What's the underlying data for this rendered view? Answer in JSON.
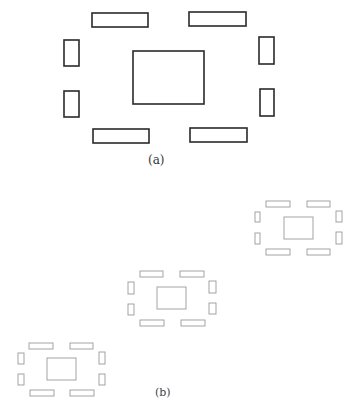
{
  "figure": {
    "panel_a": {
      "label": "(a)",
      "style": "dark",
      "stroke_color": "#2a2a2a",
      "center": {
        "x": 133,
        "y": 51,
        "w": 71,
        "h": 53
      },
      "bars": [
        {
          "name": "top-left-bar",
          "x": 92,
          "y": 13,
          "w": 56,
          "h": 14
        },
        {
          "name": "top-right-bar",
          "x": 189,
          "y": 12,
          "w": 57,
          "h": 14
        },
        {
          "name": "bottom-left-bar",
          "x": 93,
          "y": 129,
          "w": 56,
          "h": 14
        },
        {
          "name": "bottom-right-bar",
          "x": 190,
          "y": 128,
          "w": 57,
          "h": 14
        },
        {
          "name": "left-upper-block",
          "x": 64,
          "y": 40,
          "w": 15,
          "h": 26
        },
        {
          "name": "left-lower-block",
          "x": 64,
          "y": 91,
          "w": 15,
          "h": 26
        },
        {
          "name": "right-upper-block",
          "x": 259,
          "y": 37,
          "w": 15,
          "h": 27
        },
        {
          "name": "right-lower-block",
          "x": 260,
          "y": 89,
          "w": 14,
          "h": 27
        }
      ]
    },
    "panel_b": {
      "label": "(b)",
      "style": "light",
      "stroke_color": "#9a9a9a",
      "groups": [
        {
          "name": "group-upper-right",
          "center": {
            "x": 284,
            "y": 217,
            "w": 29,
            "h": 22
          },
          "bars": [
            {
              "x": 266,
              "y": 201,
              "w": 24,
              "h": 6
            },
            {
              "x": 307,
              "y": 201,
              "w": 23,
              "h": 6
            },
            {
              "x": 266,
              "y": 249,
              "w": 24,
              "h": 6
            },
            {
              "x": 307,
              "y": 249,
              "w": 23,
              "h": 6
            },
            {
              "x": 255,
              "y": 212,
              "w": 5,
              "h": 10
            },
            {
              "x": 255,
              "y": 233,
              "w": 5,
              "h": 11
            },
            {
              "x": 336,
              "y": 211,
              "w": 6,
              "h": 11
            },
            {
              "x": 336,
              "y": 232,
              "w": 6,
              "h": 12
            }
          ]
        },
        {
          "name": "group-middle",
          "center": {
            "x": 157,
            "y": 287,
            "w": 29,
            "h": 22
          },
          "bars": [
            {
              "x": 140,
              "y": 271,
              "w": 23,
              "h": 6
            },
            {
              "x": 180,
              "y": 271,
              "w": 24,
              "h": 6
            },
            {
              "x": 140,
              "y": 320,
              "w": 24,
              "h": 6
            },
            {
              "x": 181,
              "y": 320,
              "w": 24,
              "h": 6
            },
            {
              "x": 128,
              "y": 282,
              "w": 6,
              "h": 12
            },
            {
              "x": 128,
              "y": 304,
              "w": 6,
              "h": 11
            },
            {
              "x": 209,
              "y": 281,
              "w": 7,
              "h": 12
            },
            {
              "x": 209,
              "y": 303,
              "w": 7,
              "h": 11
            }
          ]
        },
        {
          "name": "group-lower-left",
          "center": {
            "x": 47,
            "y": 358,
            "w": 29,
            "h": 22
          },
          "bars": [
            {
              "x": 29,
              "y": 343,
              "w": 24,
              "h": 6
            },
            {
              "x": 70,
              "y": 343,
              "w": 23,
              "h": 6
            },
            {
              "x": 30,
              "y": 390,
              "w": 24,
              "h": 6
            },
            {
              "x": 70,
              "y": 390,
              "w": 24,
              "h": 6
            },
            {
              "x": 18,
              "y": 353,
              "w": 6,
              "h": 11
            },
            {
              "x": 18,
              "y": 374,
              "w": 6,
              "h": 11
            },
            {
              "x": 99,
              "y": 352,
              "w": 6,
              "h": 12
            },
            {
              "x": 99,
              "y": 374,
              "w": 6,
              "h": 11
            }
          ]
        }
      ]
    }
  }
}
